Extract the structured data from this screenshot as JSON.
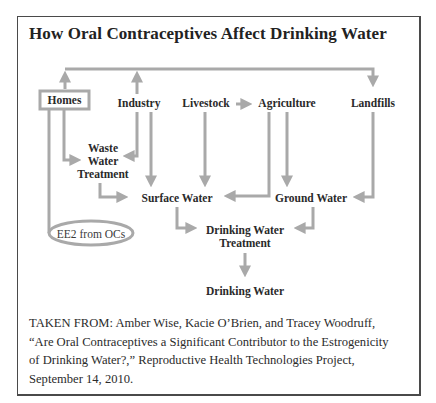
{
  "figure": {
    "title": "How Oral Contraceptives Affect Drinking Water",
    "colors": {
      "arrow": "#a9a9a9",
      "border": "#4a4a4a",
      "text": "#2a2a2a"
    },
    "nodes": {
      "homes": "Homes",
      "industry": "Industry",
      "livestock": "Livestock",
      "agriculture": "Agriculture",
      "landfills": "Landfills",
      "waste_water_treatment": [
        "Waste",
        "Water",
        "Treatment"
      ],
      "surface_water": "Surface Water",
      "ground_water": "Ground Water",
      "drinking_water_treatment": [
        "Drinking Water",
        "Treatment"
      ],
      "drinking_water": "Drinking Water",
      "source": "EE2 from OCs"
    },
    "edges": [
      {
        "from": "Homes",
        "to": "Landfills",
        "via": "top loop"
      },
      {
        "from": "Industry",
        "to": "Landfills",
        "via": "top loop"
      },
      {
        "from": "Livestock",
        "to": "Agriculture"
      },
      {
        "from": "Homes",
        "to": "Waste Water Treatment"
      },
      {
        "from": "Industry",
        "to": "Waste Water Treatment"
      },
      {
        "from": "Industry",
        "to": "Surface Water"
      },
      {
        "from": "Livestock",
        "to": "Surface Water"
      },
      {
        "from": "Agriculture",
        "to": "Surface Water"
      },
      {
        "from": "Agriculture",
        "to": "Ground Water"
      },
      {
        "from": "Landfills",
        "to": "Ground Water"
      },
      {
        "from": "Waste Water Treatment",
        "to": "Surface Water"
      },
      {
        "from": "Surface Water",
        "to": "Drinking Water Treatment"
      },
      {
        "from": "Ground Water",
        "to": "Drinking Water Treatment"
      },
      {
        "from": "Drinking Water Treatment",
        "to": "Drinking Water"
      },
      {
        "from": "EE2 from OCs",
        "to": "Homes"
      }
    ],
    "caption": [
      "TAKEN FROM: Amber Wise, Kacie O’Brien, and Tracey Woodruff,",
      "“Are Oral Contraceptives a Significant Contributor to the Estrogenicity",
      "of Drinking Water?,” Reproductive Health Technologies Project,",
      "September 14, 2010."
    ]
  }
}
